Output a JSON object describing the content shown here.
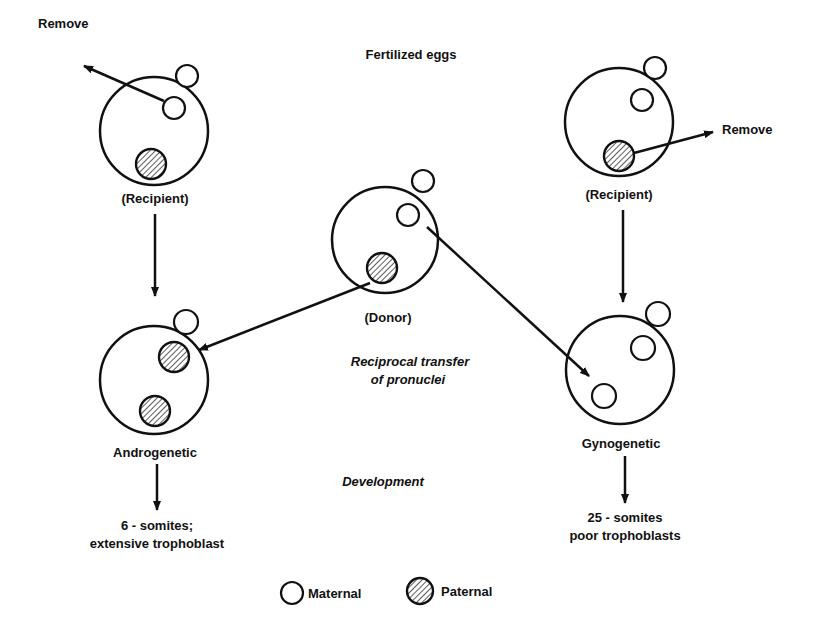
{
  "diagram": {
    "title": "Fertilized eggs",
    "center_caption_line1": "Reciprocal transfer",
    "center_caption_line2": "of pronuclei",
    "development_label": "Development",
    "left_recipient": {
      "remove_label": "Remove",
      "label": "(Recipient)",
      "removed_pronucleus": "maternal"
    },
    "right_recipient": {
      "remove_label": "Remove",
      "label": "(Recipient)",
      "removed_pronucleus": "paternal"
    },
    "donor": {
      "label": "(Donor)"
    },
    "androgenetic": {
      "label": "Androgenetic",
      "outcome_line1": "6 - somites;",
      "outcome_line2": "extensive trophoblast",
      "pronuclei": [
        "paternal",
        "paternal"
      ]
    },
    "gynogenetic": {
      "label": "Gynogenetic",
      "outcome_line1": "25 - somites",
      "outcome_line2": "poor trophoblasts",
      "pronuclei": [
        "maternal",
        "maternal"
      ]
    },
    "legend": {
      "maternal_label": "Maternal",
      "paternal_label": "Paternal",
      "maternal_icon": "open-circle",
      "paternal_icon": "hatched-circle"
    },
    "colors": {
      "ink": "#111111",
      "background": "#ffffff"
    }
  }
}
